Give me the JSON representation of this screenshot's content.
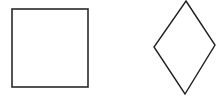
{
  "canvas": {
    "width": 223,
    "height": 99,
    "background": "#ffffff"
  },
  "shapes": [
    {
      "id": "square",
      "kind": "square",
      "stroke": "#2a2a2a",
      "stroke_width": 1.6,
      "fill": "none",
      "x": 12,
      "y": 9,
      "width": 76,
      "height": 78
    },
    {
      "id": "diamond",
      "kind": "diamond",
      "stroke": "#1f1f1f",
      "stroke_width": 1.4,
      "fill": "none",
      "points": [
        [
          186,
          1
        ],
        [
          215,
          45
        ],
        [
          185,
          94
        ],
        [
          154,
          47
        ]
      ]
    }
  ]
}
